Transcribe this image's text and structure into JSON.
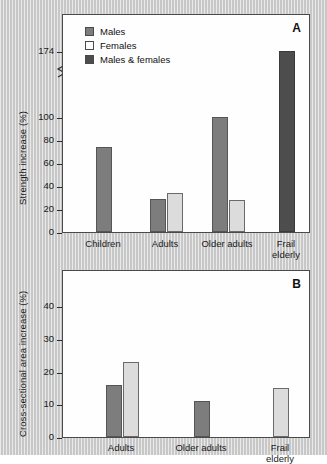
{
  "figure": {
    "background_color": "#cfcfcf",
    "panel_background": "#fefefe"
  },
  "colors": {
    "males": "#7d7d7d",
    "females": "#dcdcdc",
    "males_and_females": "#4d4d4d",
    "axis": "#2a2a2a"
  },
  "legend": {
    "items": [
      {
        "label": "Males",
        "key": "males"
      },
      {
        "label": "Females",
        "key": "females"
      },
      {
        "label": "Males & females",
        "key": "males_and_females"
      }
    ]
  },
  "panel_a": {
    "letter": "A",
    "ylabel": "Strength increase (%)",
    "yticks": [
      "0",
      "20",
      "40",
      "60",
      "80",
      "100",
      "174"
    ],
    "xticks": [
      "Children",
      "Adults",
      "Older adults",
      "Frail\nelderly"
    ],
    "axis_break": true
  },
  "panel_b": {
    "letter": "B",
    "ylabel": "Cross-sectional area increase (%)",
    "yticks": [
      "0",
      "10",
      "20",
      "30",
      "40"
    ],
    "xticks": [
      "Adults",
      "Older adults",
      "Frail\nelderly"
    ]
  },
  "chart_data": [
    {
      "type": "bar",
      "panel": "A",
      "title": "",
      "xlabel": "",
      "ylabel": "Strength increase (%)",
      "ylim": [
        0,
        174
      ],
      "ytick_values": [
        0,
        20,
        40,
        60,
        80,
        100,
        174
      ],
      "axis_break_between": [
        100,
        174
      ],
      "grid": false,
      "legend_position": "top-left",
      "categories": [
        "Children",
        "Adults",
        "Older adults",
        "Frail elderly"
      ],
      "series": [
        {
          "name": "Males",
          "color": "#7d7d7d",
          "values": [
            74,
            29,
            100,
            null
          ]
        },
        {
          "name": "Females",
          "color": "#dcdcdc",
          "values": [
            null,
            34,
            28,
            null
          ]
        },
        {
          "name": "Males & females",
          "color": "#4d4d4d",
          "values": [
            null,
            null,
            null,
            174
          ]
        }
      ]
    },
    {
      "type": "bar",
      "panel": "B",
      "title": "",
      "xlabel": "",
      "ylabel": "Cross-sectional area increase (%)",
      "ylim": [
        0,
        45
      ],
      "ytick_values": [
        0,
        10,
        20,
        30,
        40
      ],
      "grid": false,
      "legend_position": "none",
      "categories": [
        "Adults",
        "Older adults",
        "Frail elderly"
      ],
      "series": [
        {
          "name": "Males",
          "color": "#7d7d7d",
          "values": [
            16,
            11,
            null
          ]
        },
        {
          "name": "Females",
          "color": "#dcdcdc",
          "values": [
            23,
            null,
            15
          ]
        }
      ]
    }
  ]
}
